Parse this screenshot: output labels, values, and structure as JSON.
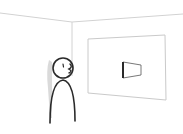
{
  "scene": {
    "description": "Stick figure standing in a room corner looking at a framed wall panel with a small box",
    "colors": {
      "background": "#ffffff",
      "room_lines": "#d0d0d0",
      "panel_border": "#c8c8c8",
      "figure_stroke": "#2a2a2a",
      "shadow": "#d8d8d8"
    }
  }
}
